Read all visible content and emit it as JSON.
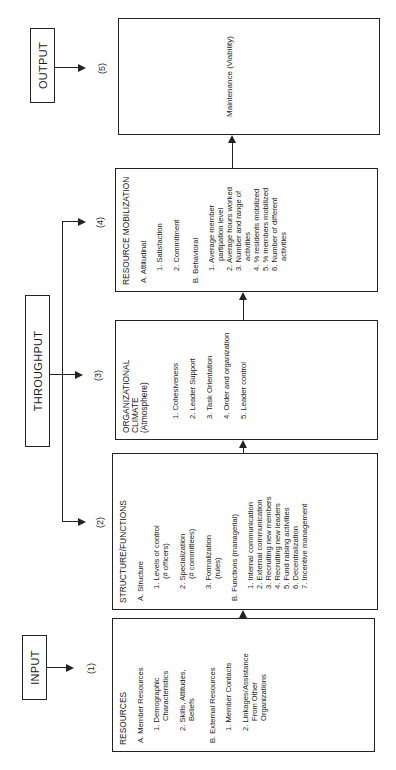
{
  "headers": {
    "input": "INPUT",
    "throughput": "THROUGHPUT",
    "output": "OUTPUT"
  },
  "stage_numbers": [
    "(1)",
    "(2)",
    "(3)",
    "(4)",
    "(5)"
  ],
  "resources": {
    "title": "RESOURCES",
    "section_a": "A. Member Resources",
    "a_items": [
      {
        "line1": "1. Demographic",
        "line2": "Characteristics"
      },
      {
        "line1": "2. Skills, Attitudes,",
        "line2": "Beliefs"
      }
    ],
    "section_b": "B. External Resources",
    "b_items": [
      {
        "line1": "1. Member Contacts",
        "line2": ""
      },
      {
        "line1": "2. Linkages/Assistance",
        "line2": "From Other",
        "line3": "Organizations"
      }
    ]
  },
  "structure": {
    "title": "STRUCTURE/FUNCTIONS",
    "section_a": "A.  Structure",
    "a_items": [
      {
        "line1": "1. Levels of control",
        "line2": "(# officers)"
      },
      {
        "line1": "2. Specialization",
        "line2": "(# committees)"
      },
      {
        "line1": "3. Formalization",
        "line2": "(rules)"
      }
    ],
    "section_b": "B. Functions (managerial)",
    "b_items": [
      "1. Internal communication",
      "2. External communication",
      "3. Recruiting new members",
      "4. Recruiting new leaders",
      "5. Fund raising activities",
      "6. Decentralization",
      "7. Incentive management"
    ]
  },
  "climate": {
    "title_line1": "ORGANIZATIONAL",
    "title_line2": "CLIMATE",
    "title_line3": "(Atmosphere)",
    "items": [
      "1. Cohesiveness",
      "2. Leader Support",
      "3. Task Orientation",
      "4. Order and organization",
      "5. Leader control"
    ]
  },
  "mobilization": {
    "title": "RESOURCE MOBILIZATION",
    "section_a": "A.  Attitudinal",
    "a_items": [
      "1. Satisfaction",
      "2. Commitment"
    ],
    "section_b": "B. Behavioral",
    "b_items": [
      {
        "line1": "1. Average member",
        "line2": "partipation level"
      },
      {
        "line1": "2. Average hours worked",
        "line2": ""
      },
      {
        "line1": "3. Number and range of",
        "line2": "activities"
      },
      {
        "line1": "4. % residents mobilized",
        "line2": ""
      },
      {
        "line1": "5. % members mobilized",
        "line2": ""
      },
      {
        "line1": "6. Number of different",
        "line2": "activities"
      }
    ]
  },
  "maintenance": {
    "label": "Maintenance (Viability)"
  }
}
